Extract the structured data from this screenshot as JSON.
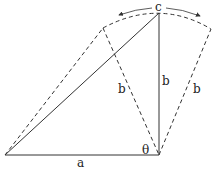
{
  "diagram": {
    "labels": {
      "top_vertex": "c",
      "vertical_side": "b",
      "left_dashed_side": "b",
      "right_dashed_side": "b",
      "base": "a",
      "angle": "θ"
    },
    "colors": {
      "stroke": "#333333",
      "background": "#ffffff"
    }
  }
}
